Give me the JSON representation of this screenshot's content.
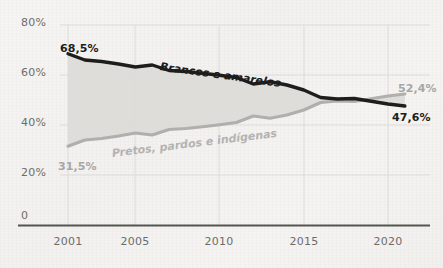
{
  "chart_data": {
    "type": "line",
    "title": "",
    "subtitle": "",
    "xlabel": "",
    "ylabel": "",
    "xlim": [
      2001,
      2021
    ],
    "ylim": [
      0,
      80
    ],
    "grid": true,
    "legend_position": "inline-labels",
    "x": [
      2001,
      2002,
      2003,
      2004,
      2005,
      2006,
      2007,
      2008,
      2009,
      2010,
      2011,
      2012,
      2013,
      2014,
      2015,
      2016,
      2017,
      2018,
      2019,
      2020,
      2021
    ],
    "y_ticks": [
      0,
      20,
      40,
      60,
      80
    ],
    "y_tick_labels": [
      "0",
      "20%",
      "40%",
      "60%",
      "80%"
    ],
    "x_ticks": [
      2001,
      2005,
      2010,
      2015,
      2020
    ],
    "x_tick_labels": [
      "2001",
      "2005",
      "2010",
      "2015",
      "2020"
    ],
    "series": [
      {
        "name": "Brancos e amarelos",
        "color": "#1d1d1b",
        "values": [
          68.5,
          66.0,
          65.4,
          64.4,
          63.2,
          64.0,
          61.8,
          61.4,
          60.7,
          59.9,
          59.0,
          56.4,
          57.3,
          56.0,
          54.0,
          51.0,
          50.4,
          50.6,
          49.5,
          48.4,
          47.6
        ]
      },
      {
        "name": "Pretos, pardos e indígenas",
        "color": "#b0b0b0",
        "values": [
          31.5,
          34.0,
          34.6,
          35.6,
          36.8,
          36.0,
          38.2,
          38.6,
          39.3,
          40.1,
          41.0,
          43.6,
          42.7,
          44.0,
          46.0,
          49.0,
          49.6,
          49.4,
          50.5,
          51.6,
          52.4
        ]
      }
    ],
    "annotations": [
      {
        "text": "68,5%",
        "series": "Brancos e amarelos",
        "x": 2001,
        "y": 68.5,
        "style": "dark"
      },
      {
        "text": "47,6%",
        "series": "Brancos e amarelos",
        "x": 2021,
        "y": 47.6,
        "style": "dark"
      },
      {
        "text": "31,5%",
        "series": "Pretos, pardos e indígenas",
        "x": 2001,
        "y": 31.5,
        "style": "gray"
      },
      {
        "text": "52,4%",
        "series": "Pretos, pardos e indígenas",
        "x": 2021,
        "y": 52.4,
        "style": "gray"
      }
    ],
    "band_fill_color": "#dcdcda",
    "background_color": "#f3f2f0",
    "gridline_color": "#d9d8d6",
    "axis_color": "#55544f"
  }
}
